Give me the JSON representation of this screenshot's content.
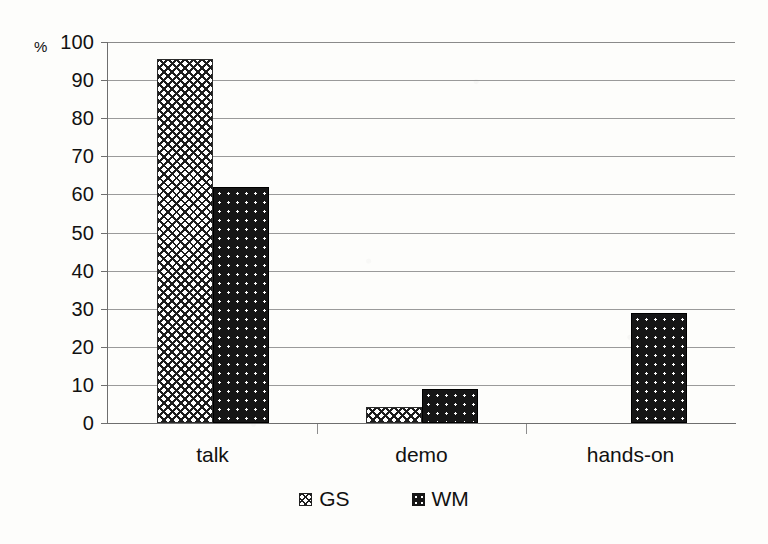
{
  "chart_data": {
    "type": "bar",
    "title": "",
    "subtitle": "",
    "xlabel": "",
    "ylabel": "%",
    "ylim": [
      0,
      100
    ],
    "ytick_step": 10,
    "yticks": [
      "100",
      "90",
      "80",
      "70",
      "60",
      "50",
      "40",
      "30",
      "20",
      "10",
      "0"
    ],
    "grid": true,
    "legend_position": "bottom",
    "categories": [
      "talk",
      "demo",
      "hands-on"
    ],
    "series": [
      {
        "name": "GS",
        "pattern": "crosshatch",
        "values": [
          95.5,
          4.3,
          0
        ]
      },
      {
        "name": "WM",
        "pattern": "dark-dotted",
        "values": [
          62,
          8.8,
          29
        ]
      }
    ]
  },
  "axis": {
    "unit_label": "%",
    "ticks": [
      {
        "label": "100",
        "value": 100
      },
      {
        "label": "90",
        "value": 90
      },
      {
        "label": "80",
        "value": 80
      },
      {
        "label": "70",
        "value": 70
      },
      {
        "label": "60",
        "value": 60
      },
      {
        "label": "50",
        "value": 50
      },
      {
        "label": "40",
        "value": 40
      },
      {
        "label": "30",
        "value": 30
      },
      {
        "label": "20",
        "value": 20
      },
      {
        "label": "10",
        "value": 10
      },
      {
        "label": "0",
        "value": 0
      }
    ]
  },
  "categories": [
    {
      "label": "talk"
    },
    {
      "label": "demo"
    },
    {
      "label": "hands-on"
    }
  ],
  "legend": {
    "items": [
      {
        "label": "GS",
        "swatch": "crosshatch-swatch"
      },
      {
        "label": "WM",
        "swatch": "dark-dotted-swatch"
      }
    ]
  },
  "colors": {
    "bar_gs_fill": "#ffffff",
    "bar_gs_pattern": "#1d1d1d",
    "bar_wm_fill": "#161616",
    "bar_wm_dot": "#ffffff",
    "gridline": "#9a9a9a",
    "axis": "#6e6e6e",
    "text": "#111111",
    "background": "#fdfdfb"
  }
}
